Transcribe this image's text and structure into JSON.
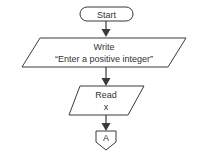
{
  "diagram": {
    "type": "flowchart",
    "colors": {
      "stroke": "#3a3a3a",
      "text": "#333333",
      "background": "#ffffff"
    },
    "nodes": [
      {
        "id": "start",
        "shape": "terminator",
        "label": "Start"
      },
      {
        "id": "write",
        "shape": "parallelogram",
        "line1": "Write",
        "line2": "“Enter a positive integer”"
      },
      {
        "id": "read",
        "shape": "parallelogram",
        "line1": "Read",
        "line2": "x"
      },
      {
        "id": "connector",
        "shape": "off-page-connector",
        "label": "A"
      }
    ],
    "edges": [
      {
        "from": "start",
        "to": "write"
      },
      {
        "from": "write",
        "to": "read"
      },
      {
        "from": "read",
        "to": "connector"
      }
    ]
  }
}
